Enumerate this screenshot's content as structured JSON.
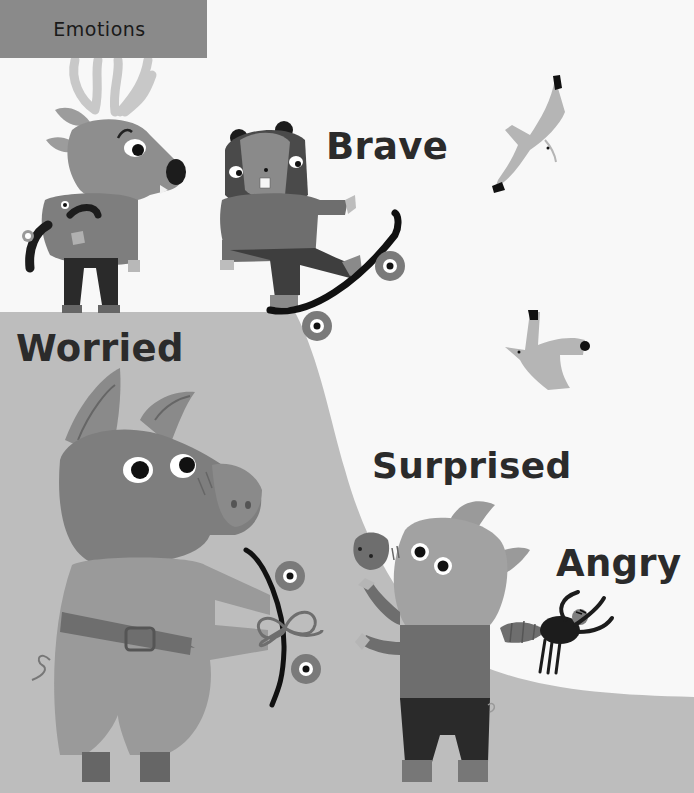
{
  "page": {
    "section_tab": "Emotions",
    "labels": {
      "brave": "Brave",
      "worried": "Worried",
      "surprised": "Surprised",
      "angry": "Angry"
    }
  },
  "colors": {
    "background": "#f8f8f8",
    "ramp": "#bdbdbd",
    "tab": "#8a8a8a",
    "text": "#2b2b2b",
    "dark": "#1c1c1c"
  },
  "characters": [
    {
      "name": "deer",
      "emotion_shown": "worried-looking",
      "position": "top-left"
    },
    {
      "name": "beaver",
      "emotion_shown": "brave",
      "position": "top-center",
      "prop": "skateboard"
    },
    {
      "name": "seagull",
      "count": 2,
      "position": "top-right"
    },
    {
      "name": "pig-large",
      "emotion_shown": "worried",
      "position": "bottom-left",
      "prop": "skateboard"
    },
    {
      "name": "pig-small",
      "emotion_shown": "surprised",
      "position": "bottom-center"
    },
    {
      "name": "bug",
      "emotion_shown": "angry",
      "position": "right"
    }
  ]
}
